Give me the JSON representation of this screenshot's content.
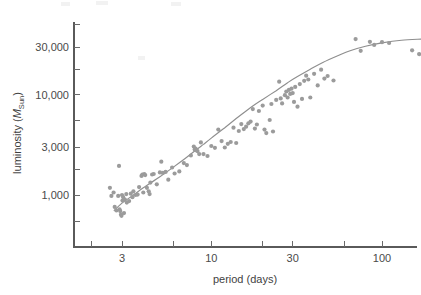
{
  "chart_data": {
    "type": "scatter",
    "title": "",
    "xlabel": "period (days)",
    "ylabel": "luminosity (M_Sun)",
    "ylabel_parts": {
      "prefix": "luminosity (",
      "symbol": "M",
      "subscript": "Sun",
      "suffix": ")"
    },
    "xscale": "log",
    "yscale": "log",
    "xlim": [
      1.9,
      190
    ],
    "ylim": [
      430,
      52000
    ],
    "grid": false,
    "legend": null,
    "xticks": [
      3,
      10,
      30,
      100
    ],
    "xtick_labels": [
      "3",
      "10",
      "30",
      "100"
    ],
    "xminor_ticks": [
      2,
      6,
      20,
      60,
      190
    ],
    "yticks": [
      1000,
      3000,
      10000,
      30000
    ],
    "ytick_labels": [
      "1,000",
      "3,000",
      "10,000",
      "30,000"
    ],
    "yminor_ticks": [
      550,
      1800,
      5500,
      18000,
      50000
    ],
    "point_color": "#9b9b9b",
    "curve_color": "#8e8e8e",
    "axis_color": "#5a5a5a",
    "point_radius_px": 2.1,
    "n_points": 112,
    "series": [
      {
        "name": "Cepheid variables",
        "points": [
          [
            2.55,
            1180
          ],
          [
            2.6,
            980
          ],
          [
            2.68,
            1060
          ],
          [
            2.72,
            760
          ],
          [
            2.78,
            700
          ],
          [
            2.85,
            980
          ],
          [
            2.88,
            1950
          ],
          [
            2.9,
            720
          ],
          [
            2.93,
            690
          ],
          [
            2.96,
            640
          ],
          [
            2.98,
            620
          ],
          [
            3.0,
            1000
          ],
          [
            3.02,
            880
          ],
          [
            3.05,
            950
          ],
          [
            3.08,
            660
          ],
          [
            3.12,
            900
          ],
          [
            3.18,
            1020
          ],
          [
            3.2,
            840
          ],
          [
            3.3,
            870
          ],
          [
            3.38,
            1030
          ],
          [
            3.45,
            950
          ],
          [
            3.5,
            1090
          ],
          [
            3.6,
            1000
          ],
          [
            3.7,
            1010
          ],
          [
            3.78,
            1200
          ],
          [
            3.9,
            1550
          ],
          [
            3.95,
            1600
          ],
          [
            4.0,
            1060
          ],
          [
            4.05,
            1620
          ],
          [
            4.1,
            1580
          ],
          [
            4.2,
            1180
          ],
          [
            4.3,
            1090
          ],
          [
            4.35,
            1020
          ],
          [
            4.4,
            1330
          ],
          [
            4.5,
            1600
          ],
          [
            4.6,
            1620
          ],
          [
            4.8,
            1280
          ],
          [
            5.0,
            1680
          ],
          [
            5.1,
            2150
          ],
          [
            5.2,
            1660
          ],
          [
            5.4,
            1700
          ],
          [
            5.6,
            1420
          ],
          [
            5.9,
            1880
          ],
          [
            6.1,
            1640
          ],
          [
            6.5,
            1720
          ],
          [
            6.9,
            2080
          ],
          [
            7.2,
            1990
          ],
          [
            7.6,
            2480
          ],
          [
            7.9,
            3050
          ],
          [
            8.0,
            2840
          ],
          [
            8.1,
            2900
          ],
          [
            8.2,
            2780
          ],
          [
            8.3,
            2740
          ],
          [
            8.5,
            2560
          ],
          [
            8.7,
            3350
          ],
          [
            9.0,
            2560
          ],
          [
            9.5,
            2450
          ],
          [
            10.0,
            3080
          ],
          [
            10.5,
            2960
          ],
          [
            11.0,
            4500
          ],
          [
            11.5,
            3450
          ],
          [
            12.0,
            2980
          ],
          [
            12.5,
            3240
          ],
          [
            13.0,
            3380
          ],
          [
            13.5,
            4700
          ],
          [
            14.0,
            3300
          ],
          [
            14.5,
            4350
          ],
          [
            15.0,
            5100
          ],
          [
            15.5,
            4550
          ],
          [
            16.0,
            4800
          ],
          [
            16.5,
            5200
          ],
          [
            17.0,
            5400
          ],
          [
            17.5,
            7200
          ],
          [
            18.0,
            4600
          ],
          [
            18.5,
            5050
          ],
          [
            19.0,
            6900
          ],
          [
            20.0,
            7800
          ],
          [
            20.5,
            4500
          ],
          [
            21.0,
            4150
          ],
          [
            22.0,
            5600
          ],
          [
            22.5,
            8100
          ],
          [
            23.0,
            4300
          ],
          [
            24.0,
            8900
          ],
          [
            25.0,
            13500
          ],
          [
            25.5,
            9200
          ],
          [
            26.0,
            8200
          ],
          [
            27.0,
            9900
          ],
          [
            27.5,
            10800
          ],
          [
            28.0,
            9400
          ],
          [
            28.5,
            11200
          ],
          [
            29.0,
            10200
          ],
          [
            29.5,
            11500
          ],
          [
            30.0,
            10400
          ],
          [
            30.5,
            8500
          ],
          [
            31.0,
            12000
          ],
          [
            32.0,
            7600
          ],
          [
            33.0,
            12800
          ],
          [
            34.0,
            9100
          ],
          [
            35.0,
            13800
          ],
          [
            36.0,
            15500
          ],
          [
            37.0,
            14200
          ],
          [
            38.0,
            9400
          ],
          [
            40.0,
            16200
          ],
          [
            42.0,
            12400
          ],
          [
            44.0,
            17800
          ],
          [
            46.0,
            14500
          ],
          [
            48.0,
            15400
          ],
          [
            52.0,
            13900
          ],
          [
            70.0,
            36000
          ],
          [
            75.0,
            27500
          ],
          [
            85.0,
            33800
          ],
          [
            90.0,
            31500
          ],
          [
            100.0,
            33500
          ],
          [
            110.0,
            32900
          ],
          [
            150.0,
            27800
          ],
          [
            165.0,
            25500
          ]
        ]
      }
    ],
    "fit_curve": {
      "name": "fitted relation",
      "points": [
        [
          2.7,
          700
        ],
        [
          3.0,
          830
        ],
        [
          3.5,
          1000
        ],
        [
          4.0,
          1180
        ],
        [
          5.0,
          1520
        ],
        [
          6.0,
          1900
        ],
        [
          7.0,
          2300
        ],
        [
          8.0,
          2750
        ],
        [
          9.0,
          3200
        ],
        [
          10.0,
          3700
        ],
        [
          12.0,
          4700
        ],
        [
          14.0,
          5800
        ],
        [
          16.0,
          6900
        ],
        [
          18.0,
          8000
        ],
        [
          20.0,
          9000
        ],
        [
          24.0,
          11000
        ],
        [
          28.0,
          13200
        ],
        [
          32.0,
          15200
        ],
        [
          38.0,
          18000
        ],
        [
          45.0,
          21000
        ],
        [
          55.0,
          24500
        ],
        [
          65.0,
          27500
        ],
        [
          80.0,
          30500
        ],
        [
          100.0,
          33000
        ],
        [
          130.0,
          35000
        ],
        [
          170.0,
          36000
        ]
      ]
    }
  },
  "axes": {
    "x_axis_name": "period-axis",
    "y_axis_name": "luminosity-axis"
  }
}
